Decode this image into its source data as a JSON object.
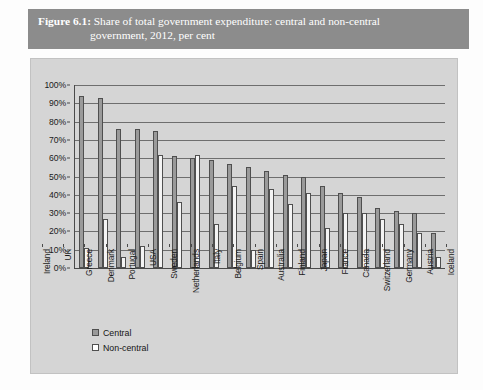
{
  "caption": {
    "label": "Figure 6.1:",
    "line1_rest": " Share of total government expenditure: central and non-central",
    "line2": "government, 2012, per cent"
  },
  "legend": {
    "items": [
      {
        "label": "Central",
        "color": "#9a9a9a"
      },
      {
        "label": "Non-central",
        "color": "#ffffff"
      }
    ]
  },
  "chart_data": {
    "type": "bar",
    "title": "Share of total government expenditure: central and non-central government, 2012, per cent",
    "xlabel": "",
    "ylabel": "",
    "ylim": [
      0,
      100
    ],
    "grid": true,
    "legend_position": "bottom-left",
    "y_ticks": [
      "0%",
      "10%",
      "20%",
      "30%",
      "40%",
      "50%",
      "60%",
      "70%",
      "80%",
      "90%",
      "100%"
    ],
    "y_tick_values": [
      0,
      10,
      20,
      30,
      40,
      50,
      60,
      70,
      80,
      90,
      100
    ],
    "categories": [
      "Ireland",
      "UK",
      "Greece",
      "Denmark",
      "Portugal",
      "USA",
      "Sweden",
      "Netherlands",
      "Italy",
      "Belgium",
      "Spain",
      "Australia",
      "Finland",
      "Japan",
      "France",
      "Canada",
      "Switzerland",
      "Germany",
      "Austria",
      "Iceland"
    ],
    "series": [
      {
        "name": "Central",
        "color": "#9a9a9a",
        "values": [
          94,
          93,
          76,
          76,
          75,
          61,
          60,
          59,
          57,
          55,
          53,
          51,
          50,
          45,
          41,
          39,
          33,
          31,
          30,
          19
        ]
      },
      {
        "name": "Non-central",
        "color": "#ffffff",
        "values": [
          11,
          27,
          6,
          12,
          62,
          36,
          62,
          24,
          45,
          10,
          43,
          35,
          41,
          22,
          30,
          30,
          27,
          24,
          19,
          6
        ]
      }
    ]
  }
}
